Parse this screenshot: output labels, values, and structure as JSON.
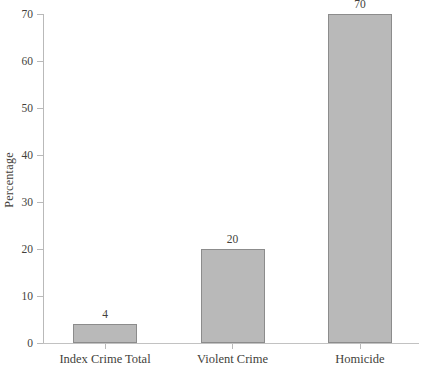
{
  "chart_data": {
    "type": "bar",
    "categories": [
      "Index Crime Total",
      "Violent Crime",
      "Homicide"
    ],
    "values": [
      4,
      20,
      70
    ],
    "bar_value_labels": [
      "4",
      "20",
      "70"
    ],
    "title": "",
    "xlabel": "",
    "ylabel": "Percentage",
    "ylim": [
      0,
      70
    ],
    "yticks": [
      0,
      10,
      20,
      30,
      40,
      50,
      60,
      70
    ],
    "grid": false,
    "legend": "none",
    "colors": {
      "background": "#ffffff",
      "bar_fill": "#b9b9b9",
      "bar_border": "#8c8c8c",
      "axis_line": "#bfbfbf",
      "text": "#433f3b"
    }
  }
}
